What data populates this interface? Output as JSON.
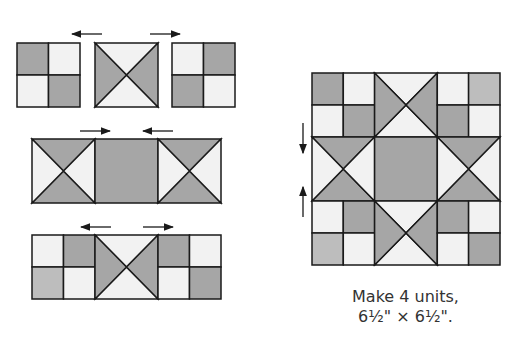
{
  "colors": {
    "dark": "#a6a6a6",
    "light": "#f2f2f2",
    "medium": "#bdbdbd",
    "line": "#1a1a1a",
    "text": "#333333"
  },
  "caption": {
    "line1": "Make 4 units,",
    "line2": "6½\" × 6½\"."
  },
  "diagram": {
    "left_rows": [
      {
        "name": "row-1",
        "units": [
          "four-patch",
          "hourglass",
          "four-patch"
        ],
        "arrows": [
          "left",
          "right"
        ]
      },
      {
        "name": "row-2",
        "units": [
          "hourglass-rotated",
          "square",
          "hourglass-rotated"
        ],
        "arrows": [
          "right",
          "left"
        ]
      },
      {
        "name": "row-3",
        "units": [
          "four-patch",
          "hourglass",
          "four-patch"
        ],
        "arrows": [
          "left",
          "right"
        ]
      }
    ],
    "assembled_block": {
      "grid": "3x3",
      "arrows": [
        "down",
        "up"
      ]
    }
  }
}
